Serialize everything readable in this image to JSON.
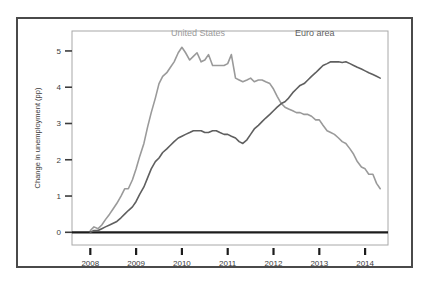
{
  "chart_data": {
    "type": "line",
    "title": "",
    "subtitle": "",
    "xlabel": "",
    "ylabel": "Change in unemployment (pp)",
    "xlim": [
      2007.6,
      2014.5
    ],
    "ylim": [
      -0.35,
      5.55
    ],
    "xticks": [
      "2008",
      "2009",
      "2010",
      "2011",
      "2012",
      "2013",
      "2014"
    ],
    "xtick_values": [
      2008,
      2009,
      2010,
      2011,
      2012,
      2013,
      2014
    ],
    "yticks": [
      "0",
      "1",
      "2",
      "3",
      "4",
      "5"
    ],
    "ytick_values": [
      0,
      1,
      2,
      3,
      4,
      5
    ],
    "grid": false,
    "legend_position": "inside-top",
    "zero_line": true,
    "series": [
      {
        "name": "United States",
        "color": "#9a9a9a",
        "label_x": 2010.35,
        "label_y": 5.4,
        "x": [
          2008.0,
          2008.08,
          2008.17,
          2008.25,
          2008.33,
          2008.42,
          2008.5,
          2008.58,
          2008.67,
          2008.75,
          2008.83,
          2008.92,
          2009.0,
          2009.08,
          2009.17,
          2009.25,
          2009.33,
          2009.42,
          2009.5,
          2009.58,
          2009.67,
          2009.75,
          2009.83,
          2009.92,
          2010.0,
          2010.08,
          2010.17,
          2010.25,
          2010.33,
          2010.42,
          2010.5,
          2010.58,
          2010.67,
          2010.75,
          2010.83,
          2010.92,
          2011.0,
          2011.08,
          2011.17,
          2011.25,
          2011.33,
          2011.42,
          2011.5,
          2011.58,
          2011.67,
          2011.75,
          2011.83,
          2011.92,
          2012.0,
          2012.08,
          2012.17,
          2012.25,
          2012.33,
          2012.42,
          2012.5,
          2012.58,
          2012.67,
          2012.75,
          2012.83,
          2012.92,
          2013.0,
          2013.08,
          2013.17,
          2013.25,
          2013.33,
          2013.42,
          2013.5,
          2013.58,
          2013.67,
          2013.75,
          2013.83,
          2013.92,
          2014.0,
          2014.08,
          2014.17,
          2014.25,
          2014.33
        ],
        "y": [
          0.05,
          0.15,
          0.1,
          0.2,
          0.35,
          0.5,
          0.65,
          0.8,
          1.0,
          1.2,
          1.2,
          1.45,
          1.75,
          2.1,
          2.45,
          2.9,
          3.3,
          3.7,
          4.1,
          4.3,
          4.4,
          4.55,
          4.7,
          4.95,
          5.1,
          4.95,
          4.75,
          4.85,
          4.95,
          4.7,
          4.75,
          4.9,
          4.6,
          4.6,
          4.6,
          4.6,
          4.65,
          4.9,
          4.25,
          4.2,
          4.15,
          4.2,
          4.25,
          4.15,
          4.2,
          4.2,
          4.15,
          4.1,
          3.95,
          3.75,
          3.55,
          3.45,
          3.4,
          3.35,
          3.3,
          3.3,
          3.25,
          3.25,
          3.2,
          3.1,
          3.1,
          2.95,
          2.8,
          2.75,
          2.7,
          2.6,
          2.5,
          2.45,
          2.3,
          2.15,
          1.95,
          1.8,
          1.75,
          1.6,
          1.6,
          1.35,
          1.2
        ]
      },
      {
        "name": "Euro area",
        "color": "#5f5f5f",
        "label_x": 2012.9,
        "label_y": 5.4,
        "x": [
          2008.0,
          2008.08,
          2008.17,
          2008.25,
          2008.33,
          2008.42,
          2008.5,
          2008.58,
          2008.67,
          2008.75,
          2008.83,
          2008.92,
          2009.0,
          2009.08,
          2009.17,
          2009.25,
          2009.33,
          2009.42,
          2009.5,
          2009.58,
          2009.67,
          2009.75,
          2009.83,
          2009.92,
          2010.0,
          2010.08,
          2010.17,
          2010.25,
          2010.33,
          2010.42,
          2010.5,
          2010.58,
          2010.67,
          2010.75,
          2010.83,
          2010.92,
          2011.0,
          2011.08,
          2011.17,
          2011.25,
          2011.33,
          2011.42,
          2011.5,
          2011.58,
          2011.67,
          2011.75,
          2011.83,
          2011.92,
          2012.0,
          2012.08,
          2012.17,
          2012.25,
          2012.33,
          2012.42,
          2012.5,
          2012.58,
          2012.67,
          2012.75,
          2012.83,
          2012.92,
          2013.0,
          2013.08,
          2013.17,
          2013.25,
          2013.33,
          2013.42,
          2013.5,
          2013.58,
          2013.67,
          2013.75,
          2013.83,
          2013.92,
          2014.0,
          2014.08,
          2014.17,
          2014.25,
          2014.33
        ],
        "y": [
          0.0,
          0.05,
          0.05,
          0.1,
          0.15,
          0.2,
          0.25,
          0.3,
          0.4,
          0.5,
          0.6,
          0.7,
          0.85,
          1.05,
          1.25,
          1.5,
          1.75,
          1.95,
          2.05,
          2.2,
          2.3,
          2.4,
          2.5,
          2.6,
          2.65,
          2.7,
          2.75,
          2.8,
          2.8,
          2.8,
          2.75,
          2.75,
          2.8,
          2.8,
          2.75,
          2.7,
          2.7,
          2.65,
          2.6,
          2.5,
          2.45,
          2.55,
          2.7,
          2.85,
          2.95,
          3.05,
          3.15,
          3.25,
          3.35,
          3.45,
          3.55,
          3.6,
          3.7,
          3.85,
          3.95,
          4.05,
          4.1,
          4.2,
          4.3,
          4.4,
          4.5,
          4.6,
          4.65,
          4.7,
          4.7,
          4.7,
          4.68,
          4.7,
          4.65,
          4.6,
          4.55,
          4.5,
          4.45,
          4.4,
          4.35,
          4.3,
          4.25
        ]
      }
    ]
  },
  "axes": {
    "y_axis_title": "Change in unemployment (pp)"
  }
}
